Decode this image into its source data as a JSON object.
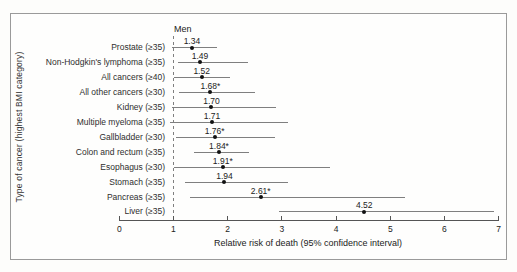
{
  "figure": {
    "group_header": "Men",
    "y_axis_label": "Type of cancer (highest BMI category)",
    "x_axis_label": "Relative risk of death (95% confidence interval)"
  },
  "chart_data": {
    "type": "scatter",
    "subtype": "forest-plot",
    "title": "Men",
    "xlabel": "Relative risk of death (95% confidence interval)",
    "ylabel": "Type of cancer (highest BMI category)",
    "xlim": [
      0,
      7
    ],
    "x_ticks": [
      "0",
      "1",
      "2",
      "3",
      "4",
      "5",
      "6",
      "7"
    ],
    "reference_line_x": 1,
    "grid": false,
    "rows": [
      {
        "label": "Prostate (≥35)",
        "rr": 1.34,
        "rr_label": "1.34",
        "ci_low": 0.97,
        "ci_high": 1.81
      },
      {
        "label": "Non-Hodgkin's lymphoma (≥35)",
        "rr": 1.49,
        "rr_label": "1.49",
        "ci_low": 1.08,
        "ci_high": 2.38
      },
      {
        "label": "All cancers (≥40)",
        "rr": 1.52,
        "rr_label": "1.52",
        "ci_low": 1.01,
        "ci_high": 2.04
      },
      {
        "label": "All other cancers (≥30)",
        "rr": 1.68,
        "rr_label": "1.68*",
        "ci_low": 1.11,
        "ci_high": 2.5
      },
      {
        "label": "Kidney (≥35)",
        "rr": 1.7,
        "rr_label": "1.70",
        "ci_low": 0.97,
        "ci_high": 2.9
      },
      {
        "label": "Multiple myeloma (≥35)",
        "rr": 1.71,
        "rr_label": "1.71",
        "ci_low": 0.93,
        "ci_high": 3.12
      },
      {
        "label": "Gallbladder (≥30)",
        "rr": 1.76,
        "rr_label": "1.76*",
        "ci_low": 1.05,
        "ci_high": 2.88
      },
      {
        "label": "Colon and rectum (≥35)",
        "rr": 1.84,
        "rr_label": "1.84*",
        "ci_low": 1.37,
        "ci_high": 2.4
      },
      {
        "label": "Esophagus (≥30)",
        "rr": 1.91,
        "rr_label": "1.91*",
        "ci_low": 1.01,
        "ci_high": 3.89
      },
      {
        "label": "Stomach (≥35)",
        "rr": 1.94,
        "rr_label": "1.94",
        "ci_low": 1.22,
        "ci_high": 3.11
      },
      {
        "label": "Pancreas (≥35)",
        "rr": 2.61,
        "rr_label": "2.61*",
        "ci_low": 1.3,
        "ci_high": 5.28
      },
      {
        "label": "Liver (≥35)",
        "rr": 4.52,
        "rr_label": "4.52",
        "ci_low": 2.94,
        "ci_high": 6.91
      }
    ]
  },
  "colors": {
    "text": "#2b2b2b",
    "ci_line": "#7f7f7f",
    "marker": "#111111",
    "frame_border": "#9a9a9a",
    "background": "#fdfdfb"
  }
}
